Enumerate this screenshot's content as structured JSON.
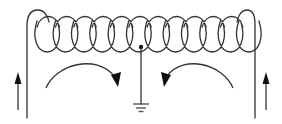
{
  "diagram": {
    "colors": {
      "background": "#ffffff",
      "wire": "#333333",
      "arrow": "#111111",
      "ground": "#555555"
    },
    "coil": {
      "loop_count": 12,
      "x_start": 30,
      "x_end": 250,
      "top_y": 11,
      "bottom_y": 52
    },
    "left_lead": {
      "x": 27,
      "y_top": 24,
      "y_bottom": 118
    },
    "right_lead": {
      "x": 255,
      "y_top": 22,
      "y_bottom": 118
    },
    "center_tap": {
      "x": 141,
      "y": 47,
      "ground_y": 104
    },
    "ground_symbol": {
      "lines": [
        16,
        10,
        5
      ]
    },
    "arrows": [
      {
        "name": "left-current-arrow",
        "direction": "up"
      },
      {
        "name": "right-current-arrow",
        "direction": "up"
      },
      {
        "name": "left-curved-flow-arrow",
        "direction": "clockwise-down"
      },
      {
        "name": "right-curved-flow-arrow",
        "direction": "counterclockwise-down"
      }
    ]
  }
}
